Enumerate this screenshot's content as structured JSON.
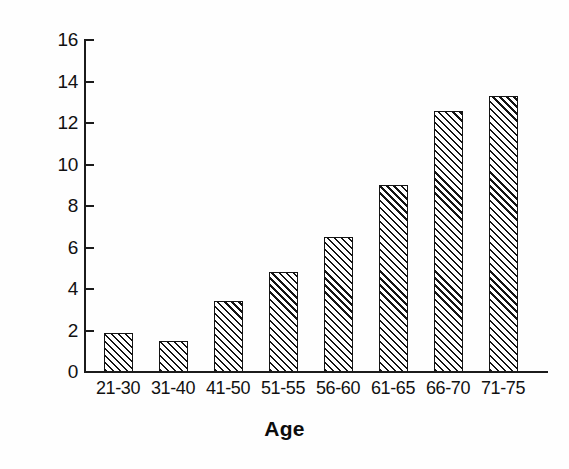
{
  "chart_data": {
    "type": "bar",
    "title": "",
    "subtitle": "",
    "xlabel": "Age",
    "ylabel": "Frequency (%)",
    "categories": [
      "21-30",
      "31-40",
      "41-50",
      "51-55",
      "56-60",
      "61-65",
      "66-70",
      "71-75"
    ],
    "values": [
      1.9,
      1.5,
      3.4,
      4.8,
      6.5,
      9.0,
      12.6,
      13.3
    ],
    "series": [
      {
        "name": "Frequency (%)",
        "values": [
          1.9,
          1.5,
          3.4,
          4.8,
          6.5,
          9.0,
          12.6,
          13.3
        ]
      }
    ],
    "ylim": [
      0,
      16
    ],
    "ytick_labels": [
      "0",
      "2",
      "4",
      "6",
      "8",
      "10",
      "12",
      "14",
      "16"
    ],
    "ytick_values": [
      0,
      2,
      4,
      6,
      8,
      10,
      12,
      14,
      16
    ],
    "xtick_labels": [
      "21-30",
      "31-40",
      "41-50",
      "51-55",
      "56-60",
      "61-65",
      "66-70",
      "71-75"
    ],
    "grid": false,
    "legend": false,
    "legend_position": "none",
    "bar_fill": "diagonal-hatch",
    "bar_edge_color": "#141414",
    "bar_face_color": "#d2d2d2",
    "axis_color": "#1b1b1b",
    "background_color": "#ffffff"
  }
}
